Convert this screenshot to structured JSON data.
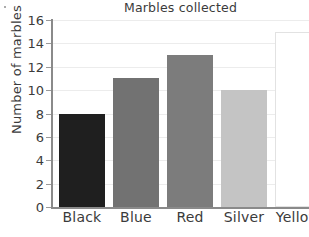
{
  "chart_data": {
    "type": "bar",
    "title": "Marbles collected",
    "xlabel": "",
    "ylabel": "Number of marbles",
    "categories": [
      "Black",
      "Blue",
      "Red",
      "Silver",
      "Yellow"
    ],
    "values": [
      8,
      11,
      13,
      10,
      15
    ],
    "bar_colors": [
      "#1f1f1f",
      "#727272",
      "#7c7c7c",
      "#c4c4c4",
      "#ffffff"
    ],
    "ylim": [
      0,
      16
    ],
    "ytick_step": 2,
    "yticks": [
      0,
      2,
      4,
      6,
      8,
      10,
      12,
      14,
      16
    ],
    "ytick_labels": [
      "0",
      "2",
      "4",
      "6",
      "8",
      "10",
      "12",
      "14",
      "16"
    ],
    "grid": true,
    "grid_axis": "y",
    "grid_color": "#ececec",
    "legend": false,
    "legend_position": "none",
    "axis_color": "#8a8a8a",
    "text_color": "#3b3b3b"
  }
}
